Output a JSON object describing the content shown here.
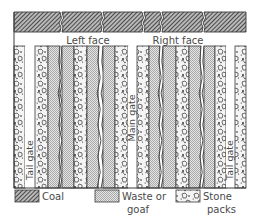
{
  "diagram": {
    "face_labels": {
      "left": "Left face",
      "right": "Right face"
    },
    "gate_labels": {
      "tail_left": "Tail gate",
      "main": "Main gate",
      "tail_right": "Tail gate"
    },
    "strip_sequence": [
      "stone",
      "gap:tail_left",
      "stone",
      "waste",
      "break",
      "waste",
      "stone",
      "waste",
      "break",
      "waste",
      "stone",
      "gap:main",
      "stone",
      "waste",
      "break",
      "waste",
      "stone",
      "waste",
      "break",
      "waste",
      "stone",
      "gap:tail_right",
      "stone"
    ],
    "coal_seam_blocks": 6,
    "legend": [
      {
        "key": "coal",
        "label_line1": "Coal",
        "label_line2": ""
      },
      {
        "key": "waste",
        "label_line1": "Waste or",
        "label_line2": "goaf"
      },
      {
        "key": "stone",
        "label_line1": "Stone",
        "label_line2": "packs"
      }
    ],
    "colors": {
      "line": "#3a3a3a",
      "coal_dark": "#3c3c3c",
      "coal_light": "#bdbdbd",
      "waste": "#cfcfcf",
      "text": "#4a4a4a"
    }
  }
}
